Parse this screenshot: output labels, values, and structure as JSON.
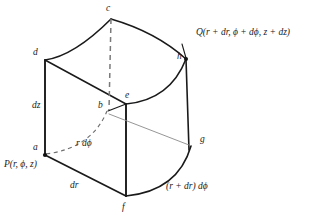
{
  "figure": {
    "stroke_color": "#1a1a1a",
    "dashed_color": "#555555",
    "background": "#ffffff"
  },
  "vertices": [
    {
      "id": "c",
      "label": "c",
      "x": 111,
      "y": 19
    },
    {
      "id": "d",
      "label": "d",
      "x": 45,
      "y": 60
    },
    {
      "id": "h",
      "label": "h",
      "x": 186,
      "y": 59
    },
    {
      "id": "b",
      "label": "b",
      "x": 108,
      "y": 111
    },
    {
      "id": "e",
      "label": "e",
      "x": 126,
      "y": 104
    },
    {
      "id": "a",
      "label": "a",
      "x": 45,
      "y": 155
    },
    {
      "id": "g",
      "label": "g",
      "x": 196,
      "y": 144
    },
    {
      "id": "f",
      "label": "f",
      "x": 126,
      "y": 196
    }
  ],
  "annotations": {
    "point_P": "P(r, ϕ, z)",
    "point_Q": "Q(r + dr, ϕ + dϕ, z + dz)",
    "edge_dz": "dz",
    "edge_dr": "dr",
    "arc_r_dphi": "r dϕ",
    "arc_r_plus_dr_dphi": "(r + dr) dϕ"
  }
}
